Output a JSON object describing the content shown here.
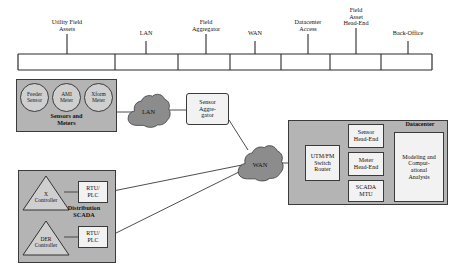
{
  "diagram": {
    "colors": {
      "panel_fill": "#b4b4b4",
      "circle_fill": "#cfcfcf",
      "box_fill": "#f2f2f2",
      "cloud_fill": "#8c8c8c",
      "line": "#3a3a3a"
    }
  },
  "phase_bar": {
    "segments": [
      {
        "label": "Utility Field\nAssets"
      },
      {
        "label": "LAN"
      },
      {
        "label": "Field\nAggregator"
      },
      {
        "label": "WAN"
      },
      {
        "label": "Datacenter\nAccess"
      },
      {
        "label": "Field\nAsset\nHead-End"
      },
      {
        "label": "Back-Office"
      }
    ]
  },
  "sensors_panel": {
    "label": "Sensors and\nMeters",
    "nodes": [
      {
        "label": "Feeder\nSensor"
      },
      {
        "label": "AMI\nMeter"
      },
      {
        "label": "Xform\nMeter"
      }
    ]
  },
  "scada_panel": {
    "label": "Distribution\nSCADA",
    "controllers": [
      {
        "label": "X\nController"
      },
      {
        "label": "DER\nController"
      }
    ],
    "rtus": [
      {
        "label": "RTU/\nPLC"
      },
      {
        "label": "RTU/\nPLC"
      }
    ]
  },
  "clouds": [
    {
      "label": "LAN"
    },
    {
      "label": "WAN"
    }
  ],
  "aggregator": {
    "label": "Sensor\nAggre-\ngator"
  },
  "datacenter_panel": {
    "label": "Datacenter",
    "edge_node": {
      "label": "UTM/FM\nSwitch\nRouter"
    },
    "head_ends": [
      {
        "label": "Sensor\nHead-End"
      },
      {
        "label": "Meter\nHead-End"
      },
      {
        "label": "SCADA\nMTU"
      }
    ],
    "analysis": {
      "label": "Modeling and\nComput-\national\nAnalysis"
    }
  }
}
